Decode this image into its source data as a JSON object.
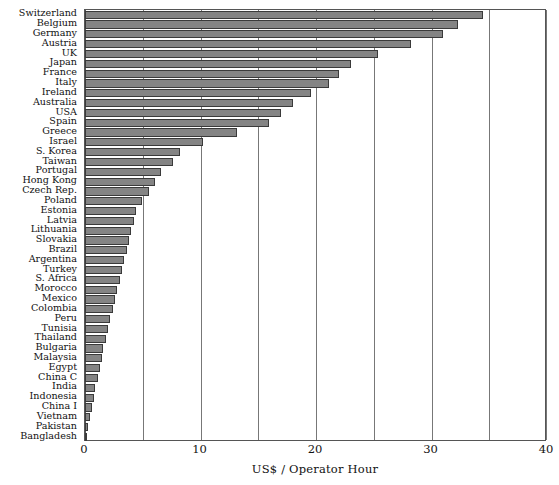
{
  "chart_data": {
    "type": "bar",
    "orientation": "horizontal",
    "title": "",
    "subtitle": "",
    "xlabel": "US$ / Operator Hour",
    "ylabel": "",
    "xlim": [
      0,
      40
    ],
    "xticks": [
      0,
      10,
      20,
      30,
      40
    ],
    "xtick_labels": [
      "0",
      "10",
      "20",
      "30",
      "40"
    ],
    "gridlines_x": [
      0,
      5,
      10,
      15,
      20,
      25,
      30,
      35,
      40
    ],
    "grid": true,
    "legend": null,
    "bar_color": "#848484",
    "bar_edge_color": "#3a3a3a",
    "axis_color": "#555555",
    "background": "#ffffff",
    "categories": [
      "Switzerland",
      "Belgium",
      "Germany",
      "Austria",
      "UK",
      "Japan",
      "France",
      "Italy",
      "Ireland",
      "Australia",
      "USA",
      "Spain",
      "Greece",
      "Israel",
      "S. Korea",
      "Taiwan",
      "Portugal",
      "Hong Kong",
      "Czech Rep.",
      "Poland",
      "Estonia",
      "Latvia",
      "Lithuania",
      "Slovakia",
      "Brazil",
      "Argentina",
      "Turkey",
      "S. Africa",
      "Morocco",
      "Mexico",
      "Colombia",
      "Peru",
      "Tunisia",
      "Thailand",
      "Bulgaria",
      "Malaysia",
      "Egypt",
      "China C",
      "India",
      "Indonesia",
      "China I",
      "Vietnam",
      "Pakistan",
      "Bangladesh"
    ],
    "values": [
      34.5,
      32.3,
      31.0,
      28.2,
      25.4,
      23.0,
      22.0,
      21.1,
      19.6,
      18.0,
      17.0,
      15.9,
      13.2,
      10.2,
      8.2,
      7.6,
      6.6,
      6.1,
      5.5,
      4.9,
      4.4,
      4.2,
      4.0,
      3.8,
      3.6,
      3.4,
      3.2,
      3.0,
      2.8,
      2.6,
      2.4,
      2.2,
      2.0,
      1.8,
      1.6,
      1.5,
      1.3,
      1.1,
      0.9,
      0.8,
      0.6,
      0.45,
      0.3,
      0.15
    ]
  }
}
